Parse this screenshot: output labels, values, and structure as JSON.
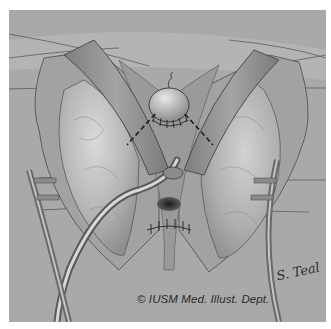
{
  "illustration": {
    "subject": "surgical illustration of urethral/bladder neck anastomosis with retractors and catheter",
    "credit": "© IUSM Med. Illust. Dept.",
    "signature": "S. Teal",
    "colors": {
      "page_background": "#ffffff",
      "frame_background": "#a9a9a9",
      "tissue_light": "#c8c8c8",
      "tissue_mid": "#9c9c9c",
      "outline": "#4a4a4a",
      "suture_dashes": "#1e1e1e"
    }
  }
}
